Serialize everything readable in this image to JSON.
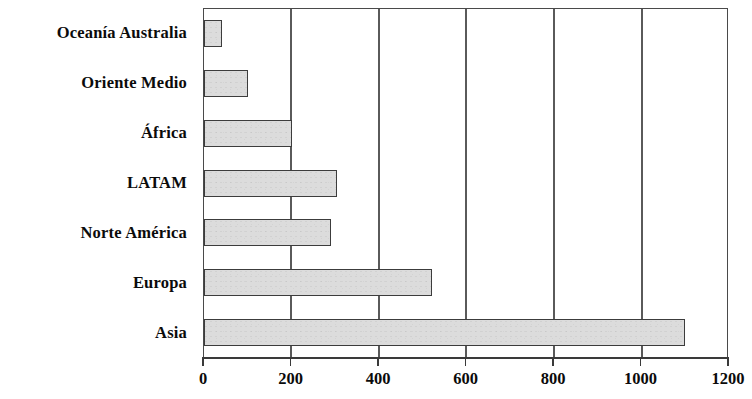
{
  "chart_data": {
    "type": "bar",
    "orientation": "horizontal",
    "title": "",
    "subtitle": "",
    "xlabel": "",
    "ylabel": "",
    "categories": [
      "Asia",
      "Europa",
      "Norte América",
      "LATAM",
      "África",
      "Oriente Medio",
      "Oceanía Australia"
    ],
    "values": [
      1100,
      520,
      290,
      305,
      200,
      100,
      40
    ],
    "series": [
      {
        "name": "",
        "values": [
          1100,
          520,
          290,
          305,
          200,
          100,
          40
        ]
      }
    ],
    "xlim": [
      0,
      1200
    ],
    "xticks": [
      0,
      200,
      400,
      600,
      800,
      1000,
      1200
    ],
    "xtick_labels": [
      "0",
      "200",
      "400",
      "600",
      "800",
      "1000",
      "1200"
    ],
    "grid": "vertical",
    "legend": "none",
    "bar_fill_color": "#dcdcdc",
    "bar_border_color": "#3c3c3c",
    "axis_color": "#3a3a3a",
    "text_color": "#0b0b0b",
    "background_color": "#ffffff",
    "annotations": []
  },
  "display_order_top_to_bottom": [
    {
      "label": "Oceanía Australia",
      "value": 40
    },
    {
      "label": "Oriente Medio",
      "value": 100
    },
    {
      "label": "África",
      "value": 200
    },
    {
      "label": "LATAM",
      "value": 305
    },
    {
      "label": "Norte América",
      "value": 290
    },
    {
      "label": "Europa",
      "value": 520
    },
    {
      "label": "Asia",
      "value": 1100
    }
  ]
}
